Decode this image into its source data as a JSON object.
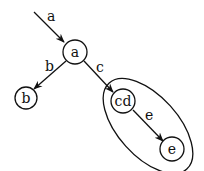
{
  "diagram": {
    "type": "state-graph",
    "entry_edge": {
      "label": "a",
      "to": "a"
    },
    "nodes": [
      {
        "id": "a",
        "label": "a"
      },
      {
        "id": "b",
        "label": "b"
      },
      {
        "id": "cd",
        "label": "cd"
      },
      {
        "id": "e",
        "label": "e"
      }
    ],
    "edges": [
      {
        "from": "a",
        "to": "b",
        "label": "b"
      },
      {
        "from": "a",
        "to": "cd",
        "label": "c"
      },
      {
        "from": "cd",
        "to": "e",
        "label": "e"
      }
    ],
    "groups": [
      {
        "members": [
          "cd",
          "e"
        ],
        "shape": "ellipse"
      }
    ],
    "colors": {
      "stroke": "#111111",
      "background": "#ffffff"
    }
  }
}
